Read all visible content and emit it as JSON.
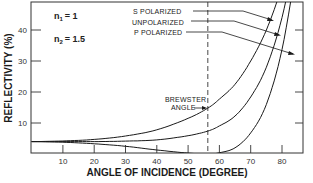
{
  "chart_data": {
    "type": "line",
    "title": "",
    "xlabel": "ANGLE OF INCIDENCE (DEGREE)",
    "ylabel": "REFLECTIVITY (%)",
    "xlim": [
      0,
      87
    ],
    "ylim": [
      0,
      49
    ],
    "grid": false,
    "x_ticks": [
      10,
      20,
      30,
      40,
      50,
      60,
      70,
      80
    ],
    "x_tick_labels": [
      "10",
      "20",
      "30",
      "40",
      "50",
      "60",
      "70",
      "80"
    ],
    "y_ticks": [
      10,
      20,
      30,
      40
    ],
    "y_tick_labels": [
      "10",
      "20",
      "30",
      "40"
    ],
    "x": [
      0,
      10,
      20,
      30,
      40,
      50,
      56.3,
      60,
      65,
      70,
      75,
      80,
      85
    ],
    "series": [
      {
        "name": "S POLARIZED",
        "values": [
          4.0,
          4.2,
          4.7,
          5.8,
          7.8,
          11.5,
          14.8,
          17.7,
          22.5,
          30.0,
          40.0,
          54.3,
          74.1
        ]
      },
      {
        "name": "UNPOLARIZED",
        "values": [
          4.0,
          4.0,
          4.0,
          4.15,
          4.55,
          5.9,
          7.4,
          9.05,
          12.25,
          18.4,
          28.0,
          44.0,
          68.5
        ]
      },
      {
        "name": "P POLARIZED",
        "values": [
          4.0,
          3.8,
          3.3,
          2.5,
          1.3,
          0.3,
          0.0,
          0.4,
          2.0,
          6.8,
          16.0,
          33.7,
          63.0
        ]
      }
    ],
    "annotations": [
      {
        "text": "n₁ = 1",
        "position": "upper-left"
      },
      {
        "text": "n₂ = 1.5",
        "position": "upper-left"
      },
      {
        "text": "BREWSTER ANGLE",
        "x": 56.3,
        "style": "dashed vertical line"
      }
    ],
    "legend": {
      "position": "upper-right, labels with leader arrows to curves"
    }
  },
  "labels": {
    "n1_symbol": "n",
    "n1_sub": "1",
    "n1_value": "= 1",
    "n2_symbol": "n",
    "n2_sub": "2",
    "n2_value": "= 1.5",
    "s_label": "S POLARIZED",
    "u_label": "UNPOLARIZED",
    "p_label": "P POLARIZED",
    "brewster_line1": "BREWSTER",
    "brewster_line2": "ANGLE",
    "xlabel": "ANGLE OF INCIDENCE (DEGREE)",
    "ylabel": "REFLECTIVITY (%)"
  },
  "colors": {
    "line": "#1a1a1a",
    "frame": "#333333",
    "background": "#ffffff"
  }
}
